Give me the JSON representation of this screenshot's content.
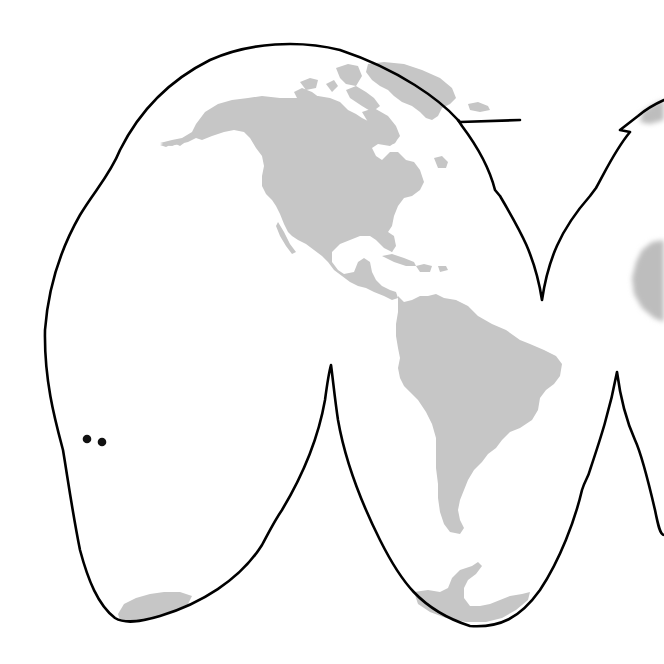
{
  "map": {
    "projection": "Goode homolosine (interrupted)",
    "visible_lobes": [
      "north-america-lobe",
      "south-america-lobe",
      "africa-lobe-partial"
    ],
    "land_color": "#c6c6c6",
    "ocean_color": "#ffffff",
    "outline_color": "#000000",
    "landmasses": [
      {
        "id": "north-america",
        "label": "North America"
      },
      {
        "id": "greenland",
        "label": "Greenland"
      },
      {
        "id": "arctic-islands",
        "label": "Canadian Arctic Archipelago"
      },
      {
        "id": "caribbean",
        "label": "Caribbean Islands"
      },
      {
        "id": "central-america",
        "label": "Central America"
      },
      {
        "id": "south-america",
        "label": "South America"
      },
      {
        "id": "antarctica-pacific",
        "label": "Antarctica (Pacific sector)"
      },
      {
        "id": "antarctic-peninsula",
        "label": "Antarctic Peninsula"
      },
      {
        "id": "africa-partial",
        "label": "Africa (partial, cropped)"
      },
      {
        "id": "europe-partial",
        "label": "Europe (partial, cropped)"
      }
    ],
    "markers": [
      {
        "id": "marker-1",
        "x": 87,
        "y": 439
      },
      {
        "id": "marker-2",
        "x": 102,
        "y": 442
      }
    ]
  }
}
